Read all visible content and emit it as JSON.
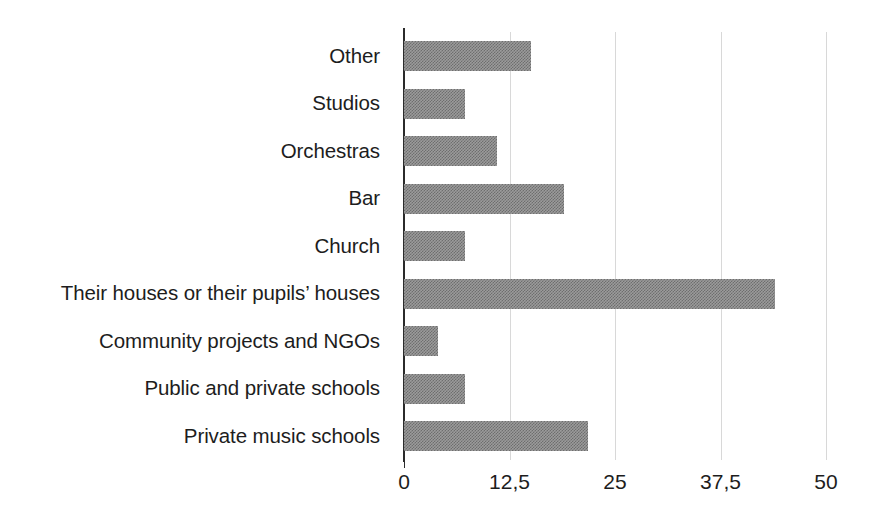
{
  "chart_data": {
    "type": "bar",
    "orientation": "horizontal",
    "title": "",
    "subtitle": "",
    "xlabel": "",
    "ylabel": "",
    "categories": [
      "Other",
      "Studios",
      "Orchestras",
      "Bar",
      "Church",
      "Their houses or their pupils’ houses",
      "Community projects and NGOs",
      "Public and private schools",
      "Private music schools"
    ],
    "values": [
      15,
      7.2,
      11,
      19,
      7.2,
      44,
      4,
      7.2,
      21.8
    ],
    "series": [
      {
        "name": "",
        "values": [
          15,
          7.2,
          11,
          19,
          7.2,
          44,
          4,
          7.2,
          21.8
        ]
      }
    ],
    "xlim": [
      0,
      50
    ],
    "xticks": [
      0,
      12.5,
      25,
      37.5,
      50
    ],
    "xticklabels": [
      "0",
      "12,5",
      "25",
      "37,5",
      "50"
    ],
    "grid": "vertical-only",
    "legend": "none",
    "bar_color": "#9b9b9b",
    "bar_pattern": "dither-checkerboard",
    "axis_color": "#2b2b2b",
    "gridline_color": "#d8d8d8",
    "background_color": "#ffffff",
    "text_color": "#1d1d1d",
    "annotations": []
  }
}
